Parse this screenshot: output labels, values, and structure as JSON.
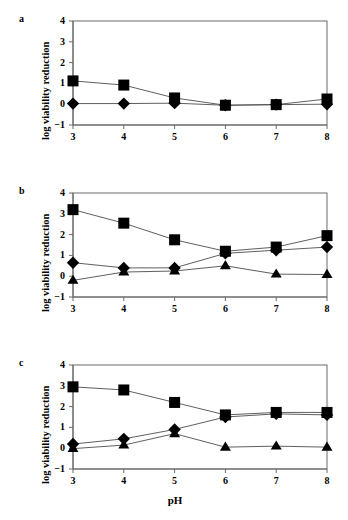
{
  "figure": {
    "xlabel": "pH",
    "ylabel": "log viability reduction",
    "panel_labels": {
      "a": "a",
      "b": "b",
      "c": "c"
    },
    "xticks": [
      "3",
      "4",
      "5",
      "6",
      "7",
      "8"
    ],
    "yticks": [
      "-1",
      "0",
      "1",
      "2",
      "3",
      "4"
    ],
    "marker_color": "#000000",
    "line_color": "#4d4d4d",
    "axis_color": "#6b6b6b"
  },
  "chart_data": [
    {
      "type": "line",
      "panel": "a",
      "title": "a",
      "xlabel": "pH",
      "ylabel": "log viability reduction",
      "x": [
        3,
        4,
        5,
        6,
        7,
        8
      ],
      "xlim": [
        3,
        8
      ],
      "ylim": [
        -1,
        4
      ],
      "xticks": [
        3,
        4,
        5,
        6,
        7,
        8
      ],
      "yticks": [
        -1,
        0,
        1,
        2,
        3,
        4
      ],
      "grid": false,
      "legend": "none",
      "series": [
        {
          "name": "square",
          "marker": "square",
          "values": [
            1.12,
            0.92,
            0.3,
            -0.05,
            -0.02,
            0.25
          ]
        },
        {
          "name": "diamond",
          "marker": "diamond",
          "values": [
            0.03,
            0.03,
            0.05,
            -0.05,
            -0.02,
            0.0
          ]
        }
      ]
    },
    {
      "type": "line",
      "panel": "b",
      "title": "b",
      "xlabel": "pH",
      "ylabel": "log viability reduction",
      "x": [
        3,
        4,
        5,
        6,
        7,
        8
      ],
      "xlim": [
        3,
        8
      ],
      "ylim": [
        -1,
        4
      ],
      "xticks": [
        3,
        4,
        5,
        6,
        7,
        8
      ],
      "yticks": [
        -1,
        0,
        1,
        2,
        3,
        4
      ],
      "grid": false,
      "legend": "none",
      "series": [
        {
          "name": "square",
          "marker": "square",
          "values": [
            3.2,
            2.55,
            1.75,
            1.2,
            1.4,
            1.95
          ]
        },
        {
          "name": "diamond",
          "marker": "diamond",
          "values": [
            0.65,
            0.4,
            0.4,
            1.1,
            1.25,
            1.4
          ]
        },
        {
          "name": "triangle",
          "marker": "triangle",
          "values": [
            -0.2,
            0.2,
            0.25,
            0.5,
            0.1,
            0.08
          ]
        }
      ]
    },
    {
      "type": "line",
      "panel": "c",
      "title": "c",
      "xlabel": "pH",
      "ylabel": "log viability reduction",
      "x": [
        3,
        4,
        5,
        6,
        7,
        8
      ],
      "xlim": [
        3,
        8
      ],
      "ylim": [
        -1,
        4
      ],
      "xticks": [
        3,
        4,
        5,
        6,
        7,
        8
      ],
      "yticks": [
        -1,
        0,
        1,
        2,
        3,
        4
      ],
      "grid": false,
      "legend": "none",
      "series": [
        {
          "name": "square",
          "marker": "square",
          "values": [
            2.95,
            2.8,
            2.2,
            1.6,
            1.72,
            1.72
          ]
        },
        {
          "name": "diamond",
          "marker": "diamond",
          "values": [
            0.2,
            0.45,
            0.9,
            1.5,
            1.65,
            1.6
          ]
        },
        {
          "name": "triangle",
          "marker": "triangle",
          "values": [
            -0.02,
            0.15,
            0.7,
            0.05,
            0.1,
            0.05
          ]
        }
      ]
    }
  ]
}
